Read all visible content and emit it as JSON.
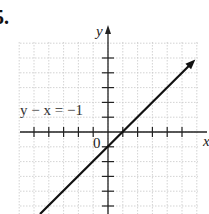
{
  "problem": {
    "number": "5."
  },
  "chart_data": {
    "type": "line",
    "title": "",
    "xlabel": "x",
    "ylabel": "y",
    "xlim": [
      -6,
      6
    ],
    "ylim": [
      -5,
      5
    ],
    "grid": true,
    "origin_label": "0",
    "y_tick_label": "1",
    "series": [
      {
        "name": "y - x = -1",
        "equation": "y − x = −1",
        "x": [
          -5,
          6
        ],
        "y": [
          -6,
          5
        ],
        "points_on_line": [
          [
            0,
            -1
          ],
          [
            1,
            0
          ]
        ],
        "arrow_end": true
      }
    ],
    "annotations": [
      {
        "text": "y − x = −1",
        "position": "left of y-axis, at y = 1"
      }
    ]
  },
  "colors": {
    "grid": "#c8c8c8",
    "axis": "#222222",
    "line": "#111111"
  }
}
